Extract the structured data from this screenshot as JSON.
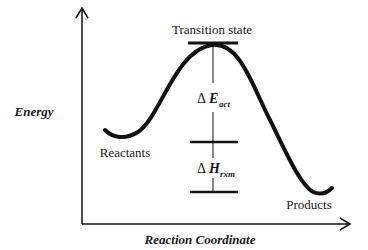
{
  "diagram": {
    "type": "reaction-energy-profile",
    "colors": {
      "line": "#111111",
      "background": "#ffffff"
    },
    "axes": {
      "y_label": "Energy",
      "x_label": "Reaction Coordinate"
    },
    "labels": {
      "transition_state": "Transition state",
      "reactants": "Reactants",
      "products": "Products",
      "delta_e_symbol": "Δ",
      "delta_e_main": "E",
      "delta_e_sub": "act",
      "delta_h_symbol": "Δ",
      "delta_h_main": "H",
      "delta_h_sub": "rxm"
    }
  }
}
